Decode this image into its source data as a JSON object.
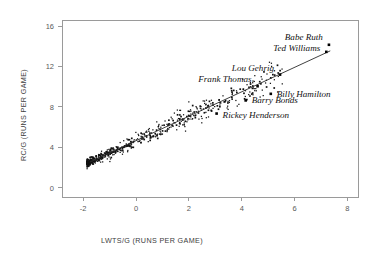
{
  "chart_data": {
    "type": "scatter",
    "title": "",
    "xlabel": "LWTS/G (RUNS PER GAME)",
    "ylabel": "RC/G (RUNS PER GAME)",
    "xlim": [
      -2.8,
      8.4
    ],
    "ylim": [
      -0.9,
      16.6
    ],
    "xticks": [
      -2,
      0,
      2,
      4,
      6,
      8
    ],
    "xtick_labels": [
      "-2",
      "0",
      "2",
      "4",
      "6",
      "8"
    ],
    "yticks": [
      0,
      4,
      8,
      12,
      16
    ],
    "ytick_labels": [
      "0",
      "4",
      "8",
      "12",
      "16"
    ],
    "grid": false,
    "legend": "none",
    "marker": "square",
    "marker_color": "#111111",
    "frame_color": "#9a9a9a",
    "regression_line": {
      "visible": true,
      "color": "#2b2b2b",
      "x_start": -1.75,
      "y_start": 2.55,
      "x_end": 7.35,
      "y_end": 13.55,
      "slope": 1.209,
      "intercept": 4.666
    },
    "annotations": [
      {
        "label": "Babe Ruth",
        "x": 7.3,
        "y": 14.15,
        "label_dx": -6,
        "label_dy": -5,
        "anchor": "end"
      },
      {
        "label": "Ted Williams",
        "x": 7.2,
        "y": 13.45,
        "label_dx": -6,
        "label_dy": -1,
        "anchor": "end"
      },
      {
        "label": "Lou Gehrig",
        "x": 5.45,
        "y": 11.2,
        "label_dx": -6,
        "label_dy": -4,
        "anchor": "end"
      },
      {
        "label": "Frank Thomas",
        "x": 4.6,
        "y": 10.05,
        "label_dx": -6,
        "label_dy": -4,
        "anchor": "end"
      },
      {
        "label": "Billy Hamilton",
        "x": 5.1,
        "y": 9.3,
        "label_dx": 6,
        "label_dy": 3,
        "anchor": "start"
      },
      {
        "label": "Barry Bonds",
        "x": 4.15,
        "y": 8.65,
        "label_dx": 6,
        "label_dy": 3,
        "anchor": "start"
      },
      {
        "label": "Rickey Henderson",
        "x": 3.05,
        "y": 7.35,
        "label_dx": 6,
        "label_dy": 4,
        "anchor": "start"
      }
    ],
    "cluster_description": "Dense elongated band of several hundred player-season points running from lower-left to upper-right along the regression line, densest between x = -1.5 and x = 2.0, thinning toward the upper right.",
    "n_points_approx": 620
  }
}
